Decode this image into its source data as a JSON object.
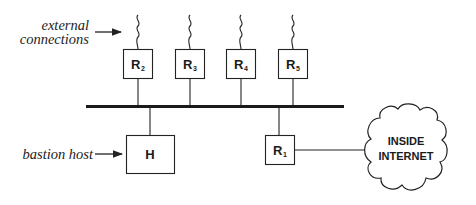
{
  "diagram": {
    "labels": {
      "external_line1": "external",
      "external_line2": "connections",
      "bastion": "bastion host"
    },
    "routers_top": [
      {
        "name": "R",
        "sub": "2"
      },
      {
        "name": "R",
        "sub": "3"
      },
      {
        "name": "R",
        "sub": "4"
      },
      {
        "name": "R",
        "sub": "5"
      }
    ],
    "router_inside": {
      "name": "R",
      "sub": "1"
    },
    "host": {
      "name": "H"
    },
    "cloud": {
      "line1": "INSIDE",
      "line2": "INTERNET"
    },
    "colors": {
      "stroke": "#222222",
      "background": "#ffffff"
    }
  }
}
